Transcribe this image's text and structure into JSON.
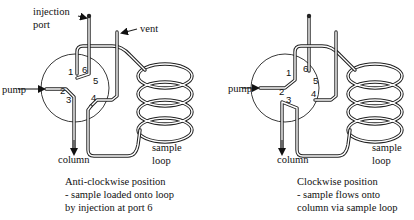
{
  "diagrams": [
    {
      "id": "anticlockwise",
      "labels": {
        "injection_port_line1": "injection",
        "injection_port_line2": "port",
        "vent": "vent",
        "pump": "pump",
        "column": "column",
        "sample_loop_line1": "sample",
        "sample_loop_line2": "loop"
      },
      "ports": [
        "1",
        "2",
        "3",
        "4",
        "5",
        "6"
      ],
      "caption": [
        "Anti-clockwise position",
        "- sample loaded onto loop",
        "by injection at port 6"
      ]
    },
    {
      "id": "clockwise",
      "labels": {
        "pump": "pump",
        "column": "column",
        "sample_loop_line1": "sample",
        "sample_loop_line2": "loop"
      },
      "ports": [
        "1",
        "2",
        "3",
        "4",
        "5",
        "6"
      ],
      "caption": [
        "Clockwise position",
        "- sample flows onto",
        "column via sample loop"
      ]
    }
  ],
  "colors": {
    "line": "#222222",
    "background": "#ffffff"
  }
}
